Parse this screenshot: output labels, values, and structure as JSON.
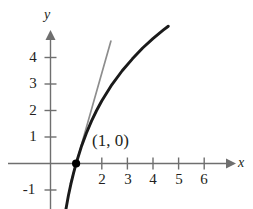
{
  "chart_data": {
    "type": "line",
    "title": "",
    "xlabel": "x",
    "ylabel": "y",
    "xlim": [
      -0.95,
      7.1
    ],
    "ylim": [
      -1.75,
      5.1
    ],
    "grid": false,
    "legend": null,
    "xticks": [
      2,
      3,
      4,
      5,
      6
    ],
    "xtick_labels": [
      "2",
      "3",
      "4",
      "5",
      "6"
    ],
    "yticks": [
      -1,
      1,
      2,
      3,
      4
    ],
    "ytick_labels": [
      "-1",
      "1",
      "2",
      "3",
      "4"
    ],
    "series": [
      {
        "name": "logarithmic-curve",
        "type": "line",
        "color": "#1a1a1a",
        "width": 2.9,
        "expression": "y = 3.4 * ln(x)",
        "x": [
          0.6,
          0.7,
          0.8,
          0.9,
          1.0,
          1.2,
          1.4,
          1.6,
          1.8,
          2.0,
          2.4,
          2.8,
          3.2,
          3.6,
          4.0,
          4.4,
          4.6
        ],
        "y": [
          -1.74,
          -1.21,
          -0.76,
          -0.36,
          0.0,
          0.62,
          1.14,
          1.6,
          2.0,
          2.36,
          2.98,
          3.5,
          3.95,
          4.36,
          4.71,
          5.03,
          5.18
        ]
      },
      {
        "name": "tangent-line",
        "type": "line",
        "color": "#8d8d8d",
        "width": 1.7,
        "expression": "y = 3.4 * (x - 1)",
        "x": [
          0.78,
          2.36
        ],
        "y": [
          -0.75,
          4.62
        ]
      }
    ],
    "points": [
      {
        "name": "tangency-point",
        "x": 1,
        "y": 0,
        "label": "(1, 0)",
        "color": "#000000"
      }
    ],
    "annotations": [
      {
        "name": "point-annotation",
        "text": "(1, 0)",
        "x": 1.6,
        "y": 0.95
      }
    ]
  },
  "axes": {
    "x_axis_name": "x",
    "y_axis_name": "y"
  },
  "labels": {
    "x_ticks": [
      "2",
      "3",
      "4",
      "5",
      "6"
    ],
    "y_ticks": [
      "4",
      "3",
      "2",
      "1",
      "-1"
    ],
    "point": "(1, 0)"
  },
  "colors": {
    "curve": "#1a1a1a",
    "tangent": "#8d8d8d",
    "axis": "#6f6f6f",
    "text": "#231f20",
    "background": "#ffffff"
  }
}
